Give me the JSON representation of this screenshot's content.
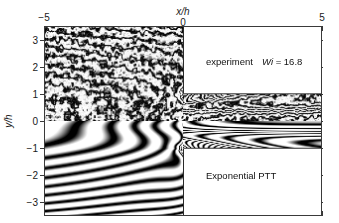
{
  "figure": {
    "kind": "flow-birefringence-fringe-comparison"
  },
  "axes": {
    "x_title": "x/h",
    "y_title": "y/h",
    "x_ticks": [
      {
        "value": -5,
        "label": "−5"
      },
      {
        "value": 0,
        "label": "0"
      },
      {
        "value": 5,
        "label": "5"
      }
    ],
    "y_ticks": [
      {
        "value": 3,
        "label": "3"
      },
      {
        "value": 2,
        "label": "2"
      },
      {
        "value": 1,
        "label": "1"
      },
      {
        "value": 0,
        "label": "0"
      },
      {
        "value": -1,
        "label": "−1"
      },
      {
        "value": -2,
        "label": "−2"
      },
      {
        "value": -3,
        "label": "−3"
      }
    ],
    "xlim": [
      -5,
      5
    ],
    "ylim": [
      -3.4,
      3.4
    ],
    "frame_color": "#3a3a3a"
  },
  "annotations": {
    "upper_label": "experiment",
    "wi_symbol": "Wi",
    "wi_equals": " = 16.8",
    "wi_value": "16.8",
    "lower_label": "Exponential PTT"
  },
  "chart_data": {
    "type": "heatmap",
    "title": "",
    "xlabel": "x/h",
    "ylabel": "y/h",
    "xlim": [
      -5,
      5
    ],
    "ylim": [
      -3.4,
      3.4
    ],
    "colormap": "grayscale-fringes",
    "grid": false,
    "legend_position": "inside",
    "panels": [
      {
        "name": "experiment",
        "region": "upper-half",
        "y_range": [
          0,
          3.4
        ],
        "annotation": "experiment   Wi = 16.8",
        "texture": "noisy"
      },
      {
        "name": "Exponential PTT",
        "region": "lower-half",
        "y_range": [
          -3.4,
          0
        ],
        "annotation": "Exponential PTT",
        "texture": "smooth"
      }
    ],
    "geometry": {
      "contraction_corner_x": 0,
      "upstream_half_width": 3.4,
      "downstream_half_width": 1,
      "walls": [
        {
          "from": [
            0,
            1
          ],
          "to": [
            5,
            1
          ]
        },
        {
          "from": [
            0,
            -1
          ],
          "to": [
            5,
            -1
          ]
        },
        {
          "from": [
            0,
            1
          ],
          "to": [
            0,
            3.4
          ]
        },
        {
          "from": [
            0,
            -1
          ],
          "to": [
            0,
            -3.4
          ]
        }
      ]
    },
    "stress_singularities": [
      {
        "x": -0.15,
        "y": 1.05,
        "panel": "experiment"
      },
      {
        "x": -0.15,
        "y": -1.05,
        "panel": "Exponential PTT"
      }
    ],
    "parameters": {
      "Wi": 16.8
    }
  }
}
